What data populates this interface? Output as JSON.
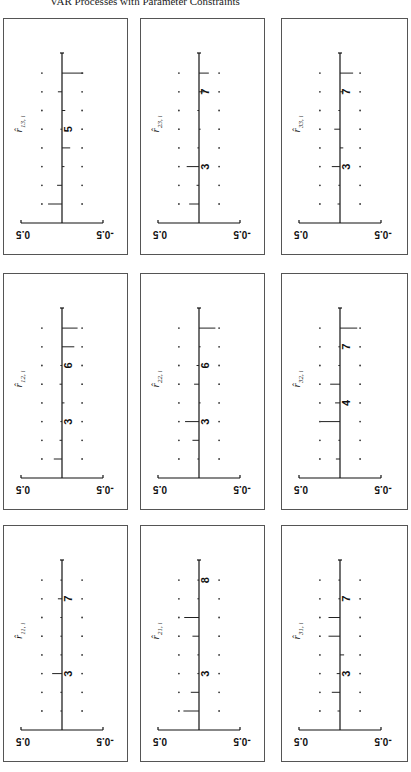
{
  "page": {
    "header": "VAR Processes with Parameter Constraints"
  },
  "colors": {
    "ink": "#111111",
    "frame": "#555555",
    "paper": "#ffffff"
  },
  "chart_data": {
    "type": "bar",
    "orientation_note": "Figure printed rotated; value axis runs from 0.5 (left) to -0.5 (right), lags run bottom-to-top",
    "xlabel": "lag i",
    "ylabel": "autocorrelation",
    "ylim": [
      -0.5,
      0.5
    ],
    "value_tick_labels": [
      "0.5",
      "-0.5"
    ],
    "lags": [
      1,
      2,
      3,
      4,
      5,
      6,
      7,
      8
    ],
    "confidence_band": 0.245,
    "grid": false,
    "panels": [
      {
        "id": "r13",
        "label": "r̂",
        "sub": "13, i",
        "row": 0,
        "col": 0,
        "values": [
          0.17,
          0.06,
          -0.03,
          -0.1,
          0.0,
          -0.04,
          0.05,
          -0.26
        ],
        "lag_labels": [
          {
            "lag": 5,
            "text": "5"
          }
        ]
      },
      {
        "id": "r23",
        "label": "r̂",
        "sub": "23, i",
        "row": 0,
        "col": 1,
        "values": [
          0.12,
          0.03,
          0.15,
          0.01,
          -0.01,
          0.0,
          -0.07,
          -0.12
        ],
        "lag_labels": [
          {
            "lag": 3,
            "text": "3"
          },
          {
            "lag": 7,
            "text": "7"
          }
        ]
      },
      {
        "id": "r33",
        "label": "r̂",
        "sub": "33, i",
        "row": 0,
        "col": 2,
        "values": [
          0.03,
          0.02,
          0.1,
          -0.04,
          0.07,
          0.02,
          -0.04,
          -0.16
        ],
        "lag_labels": [
          {
            "lag": 3,
            "text": "3"
          },
          {
            "lag": 7,
            "text": "7"
          }
        ]
      },
      {
        "id": "r12",
        "label": "r̂",
        "sub": "12, i",
        "row": 1,
        "col": 0,
        "values": [
          0.1,
          0.03,
          0.0,
          -0.03,
          0.03,
          0.0,
          -0.15,
          -0.19
        ],
        "lag_labels": [
          {
            "lag": 3,
            "text": "3"
          },
          {
            "lag": 6,
            "text": "6"
          }
        ]
      },
      {
        "id": "r22",
        "label": "r̂",
        "sub": "22, i",
        "row": 1,
        "col": 1,
        "values": [
          0.01,
          0.08,
          0.17,
          -0.01,
          0.06,
          0.03,
          -0.01,
          -0.2
        ],
        "lag_labels": [
          {
            "lag": 3,
            "text": "3"
          },
          {
            "lag": 6,
            "text": "6"
          }
        ]
      },
      {
        "id": "r32",
        "label": "r̂",
        "sub": "32, i",
        "row": 1,
        "col": 2,
        "values": [
          0.05,
          0.01,
          0.24,
          0.06,
          0.12,
          0.01,
          0.0,
          -0.21
        ],
        "lag_labels": [
          {
            "lag": 4,
            "text": "4"
          },
          {
            "lag": 7,
            "text": "7"
          }
        ]
      },
      {
        "id": "r11",
        "label": "r̂",
        "sub": "11, i",
        "row": 2,
        "col": 0,
        "values": [
          0.01,
          0.01,
          0.12,
          0.0,
          0.0,
          0.01,
          0.05,
          0.01
        ],
        "lag_labels": [
          {
            "lag": 3,
            "text": "3"
          },
          {
            "lag": 7,
            "text": "7"
          }
        ]
      },
      {
        "id": "r21",
        "label": "r̂",
        "sub": "21, i",
        "row": 2,
        "col": 1,
        "values": [
          0.19,
          0.1,
          0.0,
          0.02,
          0.08,
          0.18,
          0.01,
          0.0
        ],
        "lag_labels": [
          {
            "lag": 3,
            "text": "3"
          },
          {
            "lag": 8,
            "text": "8"
          }
        ]
      },
      {
        "id": "r31",
        "label": "r̂",
        "sub": "31, i",
        "row": 2,
        "col": 2,
        "values": [
          0.03,
          0.1,
          0.04,
          -0.05,
          0.14,
          0.14,
          0.0,
          0.0
        ],
        "lag_labels": [
          {
            "lag": 3,
            "text": "3"
          },
          {
            "lag": 7,
            "text": "7"
          }
        ]
      }
    ]
  }
}
